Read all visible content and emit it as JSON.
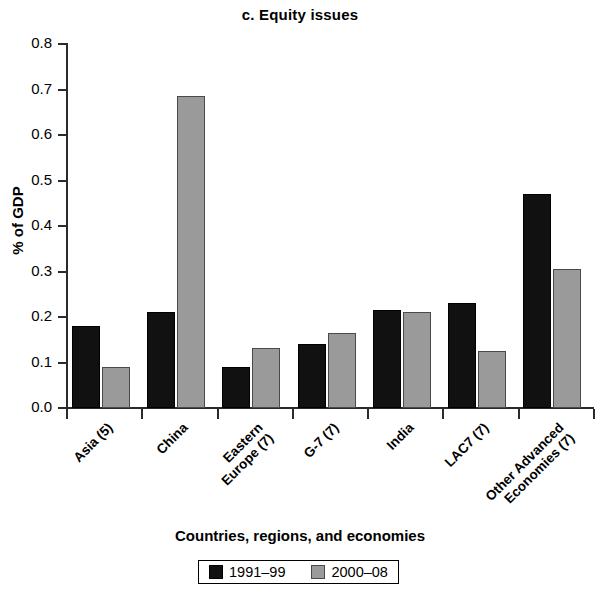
{
  "chart_data": {
    "type": "bar",
    "title": "c. Equity issues",
    "xlabel": "Countries, regions, and economies",
    "ylabel": "% of GDP",
    "categories": [
      "Asia (5)",
      "China",
      "Eastern\nEurope (7)",
      "G-7 (7)",
      "India",
      "LAC7 (7)",
      "Other Advanced\nEconomies (7)"
    ],
    "series": [
      {
        "name": "1991–99",
        "color": "#111111",
        "values": [
          0.18,
          0.21,
          0.09,
          0.14,
          0.215,
          0.23,
          0.47
        ]
      },
      {
        "name": "2000–08",
        "color": "#9a9a9a",
        "values": [
          0.09,
          0.685,
          0.132,
          0.165,
          0.21,
          0.125,
          0.305
        ]
      }
    ],
    "ylim": [
      0.0,
      0.8
    ],
    "ytick_values": [
      0.0,
      0.1,
      0.2,
      0.3,
      0.4,
      0.5,
      0.6,
      0.7,
      0.8
    ],
    "ytick_labels": [
      "0.0",
      "0.1",
      "0.2",
      "0.3",
      "0.4",
      "0.5",
      "0.6",
      "0.7",
      "0.8"
    ],
    "grid": false,
    "legend_position": "bottom"
  },
  "legend": {
    "entries": [
      {
        "label": "1991–99"
      },
      {
        "label": "2000–08"
      }
    ]
  }
}
